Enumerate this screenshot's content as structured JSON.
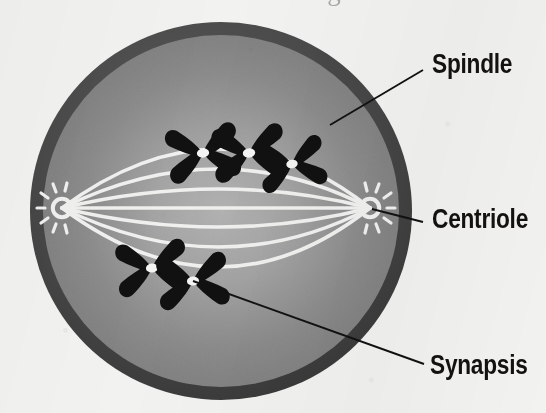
{
  "figure": {
    "kind": "biology-cell-diagram",
    "width": 546,
    "height": 413,
    "caption_fragment": "Parts of a cell during meiosis"
  },
  "colors": {
    "paper_background": "#f2f2f0",
    "cell_membrane": "#4a4a4a",
    "cytoplasm_outer": "#7c7c7c",
    "cytoplasm_inner": "#a9a9a9",
    "spindle_fiber": "#f0f0ee",
    "chromosome": "#111111",
    "centromere": "#f4f4f2",
    "leader_line": "#111111",
    "label_text": "#14120f"
  },
  "cell": {
    "center_x": 221,
    "center_y": 211,
    "radius_x": 191,
    "radius_y": 189,
    "membrane_thickness": 13
  },
  "labels": [
    {
      "id": "spindle",
      "text": "Spindle",
      "x": 432,
      "y": 51,
      "points_to": "outer-spindle-fiber"
    },
    {
      "id": "centriole",
      "text": "Centriole",
      "x": 432,
      "y": 206,
      "points_to": "right-centriole"
    },
    {
      "id": "synapsis",
      "text": "Synapsis",
      "x": 430,
      "y": 352,
      "points_to": "lower-chromosome-pair-2"
    }
  ],
  "leader_lines": [
    {
      "id": "spindle-leader",
      "x1": 423,
      "y1": 70,
      "x2": 330,
      "y2": 125
    },
    {
      "id": "centriole-leader",
      "x1": 423,
      "y1": 222,
      "x2": 372,
      "y2": 209
    },
    {
      "id": "synapsis-leader",
      "x1": 424,
      "y1": 364,
      "x2": 193,
      "y2": 281
    }
  ],
  "centrioles": [
    {
      "id": "left-centriole",
      "x": 62,
      "y": 208,
      "ray_count": 7
    },
    {
      "id": "right-centriole",
      "x": 370,
      "y": 208,
      "ray_count": 7
    }
  ],
  "spindle_fibers": {
    "count": 7,
    "description": "Seven white fibers arching pole to pole: three above the equator, one straight equatorial, three below",
    "bow_offsets": [
      -118,
      -78,
      -38,
      0,
      38,
      78,
      118
    ]
  },
  "chromosomes": {
    "upper_group": [
      {
        "id": "upper-pair-1",
        "x": 203,
        "y": 153,
        "rotation": -8,
        "scale": 1.0
      },
      {
        "id": "upper-pair-2",
        "x": 249,
        "y": 153,
        "rotation": -6,
        "scale": 1.0
      },
      {
        "id": "upper-pair-3",
        "x": 292,
        "y": 164,
        "rotation": -10,
        "scale": 0.92
      }
    ],
    "lower_group": [
      {
        "id": "lower-pair-1",
        "x": 152,
        "y": 268,
        "rotation": -6,
        "scale": 0.98
      },
      {
        "id": "lower-pair-2",
        "x": 193,
        "y": 281,
        "rotation": -6,
        "scale": 0.98
      }
    ],
    "total_visible": 5,
    "shape": "X-shaped synapsed homologous pair with white centromere at crossing point"
  }
}
